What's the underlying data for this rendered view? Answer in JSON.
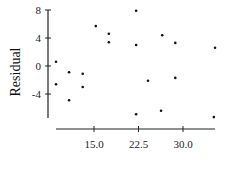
{
  "chart_data": {
    "type": "scatter",
    "title": "",
    "xlabel": "",
    "ylabel": "Residual",
    "xlim": [
      8.3,
      35.5
    ],
    "ylim": [
      -7.5,
      8
    ],
    "grid": false,
    "legend": null,
    "x_ticks": [
      15.0,
      22.5,
      30.0
    ],
    "x_tick_labels": [
      "15.0",
      "22.5",
      "30.0"
    ],
    "y_ticks": [
      8,
      4,
      0,
      -4
    ],
    "y_tick_labels": [
      "8",
      "4",
      "0",
      "-4"
    ],
    "series": [
      {
        "name": "residuals",
        "points": [
          {
            "x": 8.6,
            "y": 0.6
          },
          {
            "x": 8.6,
            "y": -2.6
          },
          {
            "x": 10.8,
            "y": -0.9
          },
          {
            "x": 10.8,
            "y": -4.9
          },
          {
            "x": 13.1,
            "y": -1.1
          },
          {
            "x": 13.1,
            "y": -3.0
          },
          {
            "x": 15.3,
            "y": 5.7
          },
          {
            "x": 17.5,
            "y": 4.6
          },
          {
            "x": 17.5,
            "y": 3.4
          },
          {
            "x": 22.1,
            "y": 7.9
          },
          {
            "x": 22.1,
            "y": 3.0
          },
          {
            "x": 22.1,
            "y": -6.9
          },
          {
            "x": 24.1,
            "y": -2.1
          },
          {
            "x": 26.5,
            "y": 4.4
          },
          {
            "x": 26.3,
            "y": -6.4
          },
          {
            "x": 28.7,
            "y": 3.3
          },
          {
            "x": 28.7,
            "y": -1.7
          },
          {
            "x": 35.4,
            "y": 2.6
          },
          {
            "x": 35.2,
            "y": -7.3
          }
        ]
      }
    ]
  },
  "style": {
    "point_color": "#111111",
    "axis_color": "#222222"
  }
}
